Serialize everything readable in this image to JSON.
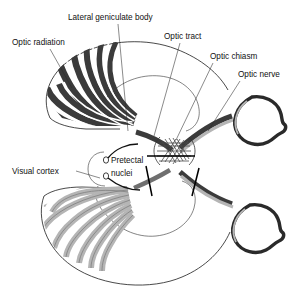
{
  "figure": {
    "background_color": "#ffffff",
    "dark_fiber_color": "#3b3b3b",
    "light_fiber_color": "#b5b5b5",
    "outline_color": "#1c1c1c",
    "label_color": "#111111"
  },
  "labels": [
    {
      "id": "optic-radiation",
      "text": "Optic radiation",
      "x": 12,
      "y": 45,
      "anchor": "start"
    },
    {
      "id": "lateral-geniculate-body",
      "text": "Lateral geniculate body",
      "x": 68,
      "y": 20,
      "anchor": "start"
    },
    {
      "id": "optic-tract",
      "text": "Optic tract",
      "x": 164,
      "y": 39,
      "anchor": "start"
    },
    {
      "id": "optic-chiasm",
      "text": "Optic chiasm",
      "x": 210,
      "y": 59,
      "anchor": "start"
    },
    {
      "id": "optic-nerve",
      "text": "Optic nerve",
      "x": 238,
      "y": 77,
      "anchor": "start"
    },
    {
      "id": "visual-cortex",
      "text": "Visual cortex",
      "x": 12,
      "y": 174,
      "anchor": "start"
    },
    {
      "id": "pretectal-nuclei-line1",
      "text": "Pretectal",
      "x": 111,
      "y": 163,
      "anchor": "start"
    },
    {
      "id": "pretectal-nuclei-line2",
      "text": "nuclei",
      "x": 111,
      "y": 176,
      "anchor": "start"
    }
  ],
  "structures": [
    {
      "id": "upper-hemisphere",
      "name": "Upper cerebral hemisphere outline"
    },
    {
      "id": "lower-hemisphere",
      "name": "Lower cerebral hemisphere outline"
    },
    {
      "id": "upper-optic-radiation-fibers",
      "name": "Upper optic radiation fiber bundles",
      "shade": "dark",
      "band_count": 5
    },
    {
      "id": "lower-optic-radiation-fibers",
      "name": "Lower optic radiation fiber bundles",
      "shade": "light",
      "band_count": 6
    },
    {
      "id": "upper-lateral-geniculate-body",
      "name": "Upper lateral geniculate body"
    },
    {
      "id": "lower-lateral-geniculate-body",
      "name": "Lower lateral geniculate body"
    },
    {
      "id": "upper-optic-tract",
      "name": "Upper optic tract",
      "shade": "dark"
    },
    {
      "id": "lower-optic-tract",
      "name": "Lower optic tract",
      "shade": "light"
    },
    {
      "id": "optic-chiasm-body",
      "name": "Optic chiasm crossing region"
    },
    {
      "id": "upper-optic-nerve",
      "name": "Upper optic nerve"
    },
    {
      "id": "lower-optic-nerve",
      "name": "Lower optic nerve"
    },
    {
      "id": "upper-eye",
      "name": "Upper eyeball with lens"
    },
    {
      "id": "lower-eye",
      "name": "Lower eyeball with lens"
    },
    {
      "id": "pretectal-nucleus-upper",
      "name": "Upper pretectal nucleus"
    },
    {
      "id": "pretectal-nucleus-lower",
      "name": "Lower pretectal nucleus"
    }
  ],
  "section_markers": [
    {
      "id": "section-marker-chiasm",
      "name": "Horizontal section bar across chiasm",
      "orientation": "horizontal"
    },
    {
      "id": "section-marker-left-tract",
      "name": "Diagonal section bar on left tract",
      "orientation": "diagonal"
    },
    {
      "id": "section-marker-right-nerve",
      "name": "Diagonal section bar on right nerve",
      "orientation": "diagonal"
    }
  ]
}
